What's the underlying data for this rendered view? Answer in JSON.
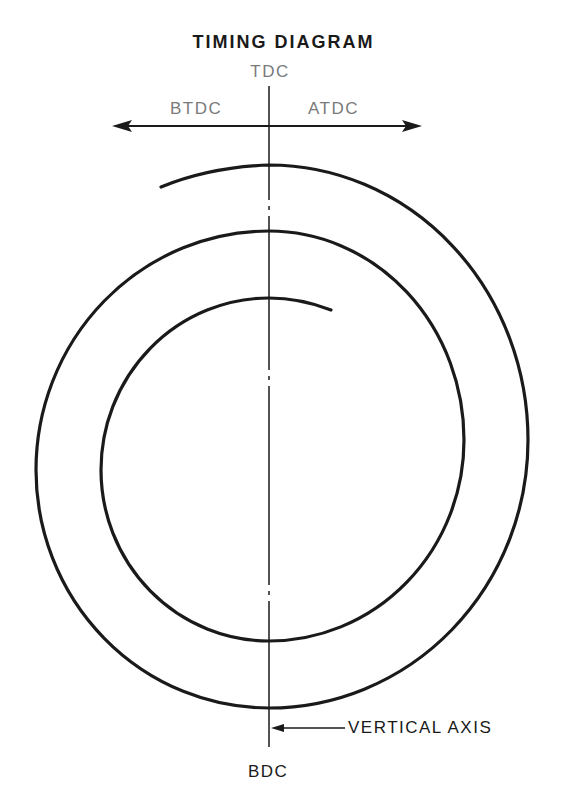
{
  "diagram": {
    "title": "TIMING DIAGRAM",
    "labels": {
      "top": "TDC",
      "left_direction": "BTDC",
      "right_direction": "ATDC",
      "bottom": "BDC",
      "axis_callout": "VERTICAL AXIS"
    },
    "colors": {
      "line": "#1a1a1a",
      "muted_label": "#7a7a7a",
      "background": "#ffffff"
    },
    "elements": {
      "horizontal_arrow": "double-headed arrow indicating BTDC (left) and ATDC (right)",
      "vertical_axis": "dash-dot center line from TDC to BDC",
      "spiral": "clockwise-opening spiral of roughly 2.4 turns centered on vertical axis"
    }
  }
}
